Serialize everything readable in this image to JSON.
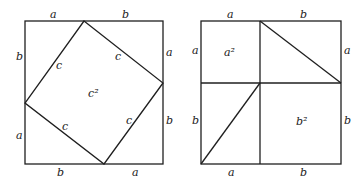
{
  "diagram": {
    "left_square": {
      "labels": {
        "top_left": "a",
        "top_right": "b",
        "right_top": "a",
        "right_bottom": "b",
        "bottom_left": "b",
        "bottom_right": "a",
        "left_top": "b",
        "left_bottom": "a",
        "hyp_1": "c",
        "hyp_2": "c",
        "hyp_3": "c",
        "hyp_4": "c",
        "center": "c²"
      }
    },
    "right_square": {
      "labels": {
        "top_left": "a",
        "top_right": "b",
        "right_top": "a",
        "right_bottom": "b",
        "bottom_left": "a",
        "bottom_right": "b",
        "left_top": "a",
        "left_bottom": "b",
        "small_square": "a²",
        "large_square": "b²"
      }
    }
  }
}
